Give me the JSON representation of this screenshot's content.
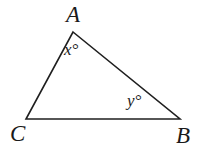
{
  "figure": {
    "kind": "geometry-triangle-diagram",
    "background_color": "#ffffff",
    "stroke_color": "#1f1f1f",
    "stroke_width": 1.6,
    "vertices": {
      "A": {
        "label": "A",
        "x": 73,
        "y": 32
      },
      "C": {
        "label": "C",
        "x": 26,
        "y": 119
      },
      "B": {
        "label": "B",
        "x": 180,
        "y": 119
      }
    },
    "edges": [
      {
        "name": "edge-AC",
        "from": "A",
        "to": "C"
      },
      {
        "name": "edge-AB",
        "from": "A",
        "to": "B"
      },
      {
        "name": "edge-CB",
        "from": "C",
        "to": "B"
      }
    ],
    "angle_labels": {
      "at_A": "x°",
      "at_B": "y°"
    },
    "polygon_points": "73,32 180,119 26,119"
  }
}
